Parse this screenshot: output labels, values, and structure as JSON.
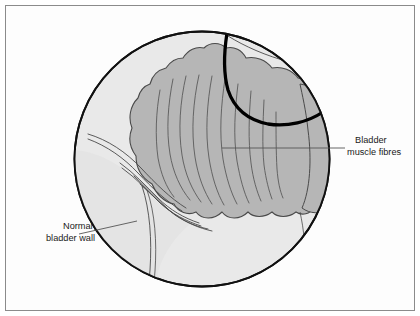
{
  "figure": {
    "view_shape": "circular-endoscopic-view",
    "background_color": "#ffffff",
    "frame_color": "#8b8b8b",
    "circle_fill": "#e9e9e9",
    "circle_stroke": "#111111",
    "organ_fill": "#b6b6b6",
    "organ_stroke": "#4a4a4a",
    "fibre_line_color": "#5a5a5a",
    "highlight_arc_color": "#000000",
    "leader_line_color": "#555555",
    "text_color": "#1a1a1a"
  },
  "labels": {
    "right": {
      "name": "bladder-muscle-fibres",
      "line1": "Bladder",
      "line2": "muscle fibres",
      "x": 355,
      "y": 143
    },
    "left": {
      "name": "normal-bladder-wall",
      "line1": "Normal",
      "line2": "bladder wall",
      "x": 63,
      "y": 229
    }
  },
  "geometry": {
    "circle": {
      "cx": 202,
      "cy": 159,
      "r": 128
    },
    "leader_right": {
      "x1": 222,
      "y1": 148,
      "x2": 345,
      "y2": 148
    },
    "leader_left": {
      "x1": 79,
      "y1": 234,
      "x2": 137,
      "y2": 221
    }
  }
}
